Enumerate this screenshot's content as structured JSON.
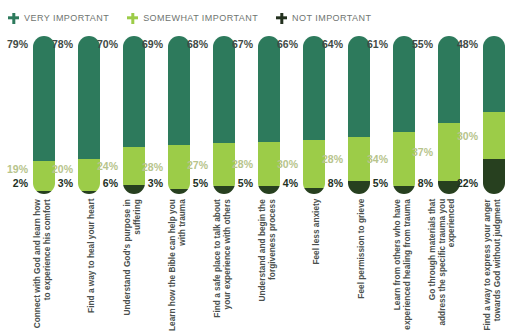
{
  "legend": {
    "items": [
      {
        "label": "VERY IMPORTANT",
        "icon": "plus-icon",
        "color": "#2d7a5c",
        "key": "very"
      },
      {
        "label": "SOMEWHAT IMPORTANT",
        "icon": "plus-icon",
        "color": "#9ccc48",
        "key": "somewhat"
      },
      {
        "label": "NOT IMPORTANT",
        "icon": "plus-icon",
        "color": "#23311f",
        "key": "not"
      }
    ]
  },
  "colors": {
    "very_important": "#2d7a5c",
    "somewhat_important": "#9ccc48",
    "not_important": "#27401f",
    "label_text": "#4a504d",
    "legend_text": "#6f7571",
    "value_very": "#3f4a46",
    "value_somewhat": "#b7c48c",
    "value_not": "#23311f",
    "background": "#ffffff"
  },
  "chart_data": {
    "type": "bar",
    "stacked": true,
    "orientation": "vertical",
    "title": "",
    "subtitle": "",
    "xlabel": "",
    "ylabel": "",
    "ylim": [
      0,
      100
    ],
    "grid": false,
    "legend_position": "top-left",
    "units": "%",
    "categories": [
      "Connect with God and learn how to experience his comfort",
      "Find a way to heal your heart",
      "Understand God's purpose in suffering",
      "Learn how the Bible can help you with trauma",
      "Find a safe place to talk about your experience with others",
      "Understand and begin the forgiveness process",
      "Feel less anxiety",
      "Feel permission to grieve",
      "Learn from others who have experienced healing from trauma",
      "Go through materials that address the specific trauma you experienced",
      "Find a way to express your anger towards God without judgment"
    ],
    "series": [
      {
        "name": "VERY IMPORTANT",
        "color": "#2d7a5c",
        "values": [
          79,
          78,
          70,
          69,
          68,
          67,
          66,
          64,
          61,
          55,
          48
        ],
        "labels": [
          "79%",
          "78%",
          "70%",
          "69%",
          "68%",
          "67%",
          "66%",
          "64%",
          "61%",
          "55%",
          "48%"
        ]
      },
      {
        "name": "SOMEWHAT IMPORTANT",
        "color": "#9ccc48",
        "values": [
          19,
          20,
          24,
          28,
          27,
          28,
          30,
          28,
          34,
          37,
          30
        ],
        "labels": [
          "19%",
          "20%",
          "24%",
          "28%",
          "27%",
          "28%",
          "30%",
          "28%",
          "34%",
          "37%",
          "30%"
        ]
      },
      {
        "name": "NOT IMPORTANT",
        "color": "#27401f",
        "values": [
          2,
          3,
          6,
          3,
          5,
          5,
          4,
          8,
          5,
          8,
          22
        ],
        "labels": [
          "2%",
          "3%",
          "6%",
          "3%",
          "5%",
          "5%",
          "4%",
          "8%",
          "5%",
          "8%",
          "22%"
        ]
      }
    ]
  }
}
